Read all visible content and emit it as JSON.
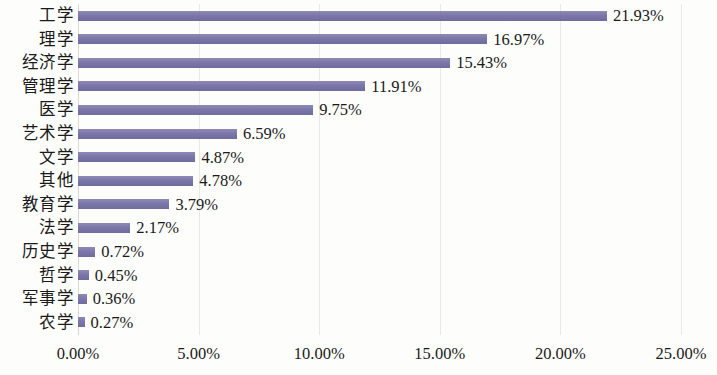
{
  "chart_data": {
    "type": "bar",
    "orientation": "horizontal",
    "title": "",
    "xlabel": "",
    "ylabel": "",
    "xlim": [
      0,
      25
    ],
    "xtick_labels": [
      "0.00%",
      "5.00%",
      "10.00%",
      "15.00%",
      "20.00%",
      "25.00%"
    ],
    "xtick_values": [
      0,
      5,
      10,
      15,
      20,
      25
    ],
    "grid": "vertical",
    "legend": "none",
    "series_color": "#7b78a9",
    "categories": [
      "工学",
      "理学",
      "经济学",
      "管理学",
      "医学",
      "艺术学",
      "文学",
      "其他",
      "教育学",
      "法学",
      "历史学",
      "哲学",
      "军事学",
      "农学"
    ],
    "values": [
      21.93,
      16.97,
      15.43,
      11.91,
      9.75,
      6.59,
      4.87,
      4.78,
      3.79,
      2.17,
      0.72,
      0.45,
      0.36,
      0.27
    ],
    "data_labels": [
      "21.93%",
      "16.97%",
      "15.43%",
      "11.91%",
      "9.75%",
      "6.59%",
      "4.87%",
      "4.78%",
      "3.79%",
      "2.17%",
      "0.72%",
      "0.45%",
      "0.36%",
      "0.27%"
    ]
  }
}
